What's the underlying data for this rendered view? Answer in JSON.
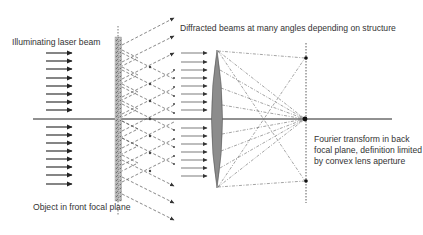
{
  "diagram": {
    "labels": {
      "illuminating": "Illuminating laser beam",
      "diffracted": "Diffracted beams at many angles depending on structure",
      "object": "Object in front focal plane",
      "fourier": "Fourier transform in back\nfocal plane, definition limited\nby convex lens aperture"
    },
    "colors": {
      "line": "#222222",
      "dashed": "#555555",
      "object_fill": "#a8a8a8",
      "lens_fill": "#8c8c8c",
      "text": "#333333"
    },
    "elements": [
      "illuminating-beam-arrows",
      "optical-axis",
      "object-slide",
      "diffracted-beams",
      "parallel-beams-to-lens",
      "convex-lens",
      "focused-rays",
      "back-focal-plane",
      "focal-spots"
    ]
  }
}
